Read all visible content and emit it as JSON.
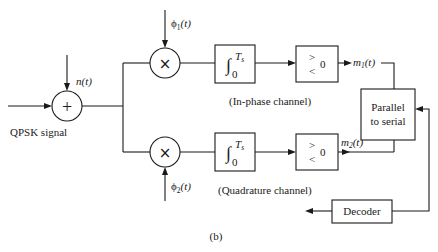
{
  "diagram": {
    "caption": "(b)",
    "input": {
      "label": "QPSK signal",
      "noise_label": "n(t)"
    },
    "summing_junction": {
      "symbol": "+"
    },
    "in_phase": {
      "multiplier_symbol": "×",
      "basis_label": "ϕ",
      "basis_sub": "1",
      "basis_arg": "(t)",
      "integrator_symbol": "∫",
      "integrator_upper": "T",
      "integrator_upper_sub": "s",
      "integrator_lower": "0",
      "comparator_gt": ">",
      "comparator_lt": "<",
      "comparator_threshold": "0",
      "output_label": "m",
      "output_sub": "1",
      "output_arg": "(t)",
      "channel_label": "(In-phase channel)"
    },
    "quadrature": {
      "multiplier_symbol": "×",
      "basis_label": "ϕ",
      "basis_sub": "2",
      "basis_arg": "(t)",
      "integrator_symbol": "∫",
      "integrator_upper": "T",
      "integrator_upper_sub": "s",
      "integrator_lower": "0",
      "comparator_gt": ">",
      "comparator_lt": "<",
      "comparator_threshold": "0",
      "output_label": "m",
      "output_sub": "2",
      "output_arg": "(t)",
      "channel_label": "(Quadrature channel)"
    },
    "parallel_to_serial": {
      "line1": "Parallel",
      "line2": "to serial"
    },
    "decoder": {
      "label": "Decoder"
    }
  }
}
